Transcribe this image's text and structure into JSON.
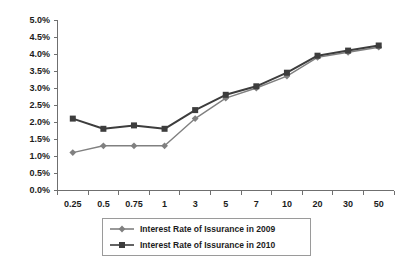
{
  "chart_data": {
    "type": "line",
    "title": "",
    "subtitle": "",
    "xlabel": "",
    "ylabel": "",
    "categories": [
      "0.25",
      "0.5",
      "0.75",
      "1",
      "3",
      "5",
      "7",
      "10",
      "20",
      "30",
      "50"
    ],
    "ytick_labels": [
      "0.0%",
      "0.5%",
      "1.0%",
      "1.5%",
      "2.0%",
      "2.5%",
      "3.0%",
      "3.5%",
      "4.0%",
      "4.5%",
      "5.0%"
    ],
    "ytick_values": [
      0.0,
      0.5,
      1.0,
      1.5,
      2.0,
      2.5,
      3.0,
      3.5,
      4.0,
      4.5,
      5.0
    ],
    "ylim": [
      0.0,
      5.0
    ],
    "grid": false,
    "legend_position": "bottom",
    "series": [
      {
        "name": "Interest Rate of Issurance in 2009",
        "color": "#808080",
        "marker": "diamond",
        "values": [
          1.1,
          1.3,
          1.3,
          1.3,
          2.1,
          2.7,
          3.0,
          3.35,
          3.9,
          4.05,
          4.2
        ]
      },
      {
        "name": "Interest Rate of Issurance in 2010",
        "color": "#3d3d3d",
        "marker": "square",
        "values": [
          2.1,
          1.8,
          1.9,
          1.8,
          2.35,
          2.8,
          3.05,
          3.45,
          3.95,
          4.1,
          4.25
        ]
      }
    ]
  },
  "legend": {
    "items": [
      {
        "label": "Interest Rate of Issurance in 2009"
      },
      {
        "label": "Interest Rate of Issurance in 2010"
      }
    ]
  }
}
